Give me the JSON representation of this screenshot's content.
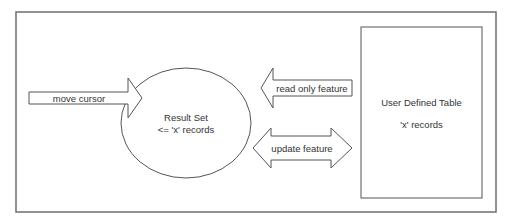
{
  "diagram": {
    "frame": {
      "x": 16,
      "y": 12,
      "w": 480,
      "h": 200
    },
    "colors": {
      "stroke": "#555555",
      "text": "#333333",
      "frame": "#777777",
      "fill": "#ffffff"
    },
    "nodes": {
      "result_set": {
        "shape": "ellipse",
        "title": "Result Set",
        "subtitle": "<= 'x' records"
      },
      "user_table": {
        "shape": "rectangle",
        "title": "User Defined Table",
        "subtitle": "'x' records"
      }
    },
    "arrows": {
      "move_cursor": {
        "label": "move cursor",
        "direction": "right",
        "target": "Result Set"
      },
      "read_only": {
        "label": "read only feature",
        "direction": "left",
        "from": "User Defined Table",
        "to": "Result Set"
      },
      "update": {
        "label": "update feature",
        "direction": "both",
        "between": [
          "Result Set",
          "User Defined Table"
        ]
      }
    }
  }
}
